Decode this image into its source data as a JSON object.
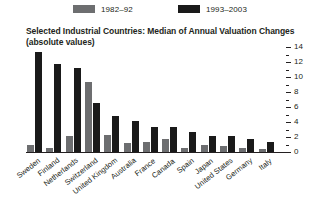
{
  "legend": {
    "items": [
      {
        "label": "1982–92",
        "color": "#6d6e70",
        "icon": "legend-swatch-gray"
      },
      {
        "label": "1993–2003",
        "color": "#1a1a1a",
        "icon": "legend-swatch-black"
      }
    ]
  },
  "title": {
    "line1": "Selected Industrial Countries: Median of Annual Valuation Changes",
    "line2": "(absolute values)"
  },
  "axis": {
    "tick_labels": [
      "14",
      "12",
      "10",
      "8",
      "6",
      "4",
      "2",
      "0"
    ],
    "position": "right"
  },
  "chart_data": {
    "type": "bar",
    "title": "Selected Industrial Countries: Median of Annual Valuation Changes (absolute values)",
    "xlabel": "",
    "ylabel": "",
    "ylim": [
      0,
      14
    ],
    "ytick_step": 2,
    "yminor_step": 1,
    "grid": false,
    "legend_position": "top",
    "axis_side": "right",
    "categories": [
      "Sweden",
      "Finland",
      "Netherlands",
      "Switzerland",
      "United Kingdom",
      "Australia",
      "France",
      "Canada",
      "Spain",
      "Japan",
      "United States",
      "Germany",
      "Italy"
    ],
    "series": [
      {
        "name": "1982–92",
        "color": "#6d6e70",
        "values": [
          1.0,
          0.6,
          2.2,
          9.3,
          2.3,
          1.2,
          1.3,
          1.7,
          0.5,
          0.9,
          0.8,
          0.6,
          0.4
        ]
      },
      {
        "name": "1993–2003",
        "color": "#1a1a1a",
        "values": [
          13.3,
          11.8,
          11.2,
          6.6,
          4.8,
          4.2,
          3.4,
          3.3,
          2.7,
          2.2,
          2.2,
          1.8,
          1.3
        ]
      }
    ]
  }
}
